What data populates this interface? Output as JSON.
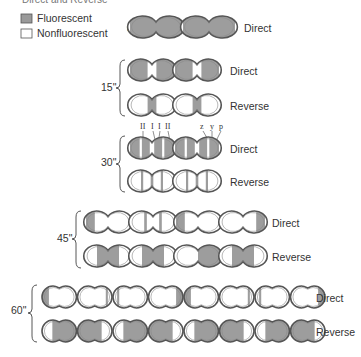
{
  "caption_fragment": "Direct and Reverse",
  "legend": [
    {
      "label": "Fluorescent",
      "swatch": "fluorescent",
      "color": "#9a9a9a"
    },
    {
      "label": "Nonfluorescent",
      "swatch": "nonfluorescent",
      "color": "#ffffff"
    }
  ],
  "colors": {
    "fluor": "#9d9d9d",
    "outline_dark": "#555555",
    "outline_light": "#888888"
  },
  "band_labels": {
    "left": [
      "II",
      "I",
      "I",
      "II"
    ],
    "right": [
      "z",
      "y",
      "p"
    ]
  },
  "timepoints": [
    {
      "time": "0\"",
      "rows": [
        {
          "label": "Direct",
          "cells": [
            [
              "full"
            ],
            [
              "full"
            ]
          ]
        }
      ]
    },
    {
      "time": "15\"",
      "rows": [
        {
          "label": "Direct",
          "cells": [
            [
              "left-half",
              "right-half-ends"
            ],
            [
              "left-half",
              "right-half-ends"
            ]
          ]
        },
        {
          "label": "Reverse",
          "cells": [
            [
              "center-band"
            ],
            [
              "center-band"
            ]
          ]
        }
      ]
    },
    {
      "time": "30\"",
      "rows": [
        {
          "label": "Direct",
          "cells": [
            [
              "full-stripes"
            ],
            [
              "full-stripes"
            ]
          ]
        },
        {
          "label": "Reverse",
          "cells": [
            [
              "stripes"
            ],
            [
              "stripes"
            ]
          ]
        }
      ]
    },
    {
      "time": "45\"",
      "rows": [
        {
          "label": "Direct",
          "cells": [
            [
              "left-cap"
            ],
            [
              "mid-bands"
            ],
            [
              "left-cap"
            ],
            [
              "right-cap"
            ]
          ]
        },
        {
          "label": "Reverse",
          "cells": [
            [
              "center-wide"
            ],
            [
              "center-wide"
            ],
            [
              "right-wide"
            ],
            [
              "center-wide"
            ]
          ]
        }
      ]
    },
    {
      "time": "60\"",
      "rows": [
        {
          "label": "Direct",
          "cells": [
            [
              "left-cap"
            ],
            [
              "right-thin"
            ],
            [
              "left-thin"
            ],
            [
              "right-cap"
            ],
            [
              "left-cap"
            ],
            [
              "right-thin"
            ],
            [
              "left-thin"
            ],
            [
              "right-cap"
            ]
          ]
        },
        {
          "label": "Reverse",
          "cells": [
            [
              "mid-right"
            ],
            [
              "mid-left"
            ],
            [
              "mid-right"
            ],
            [
              "mid-left"
            ],
            [
              "mid-right"
            ],
            [
              "mid-left"
            ],
            [
              "mid-right"
            ],
            [
              "mid-left"
            ]
          ]
        }
      ]
    }
  ]
}
